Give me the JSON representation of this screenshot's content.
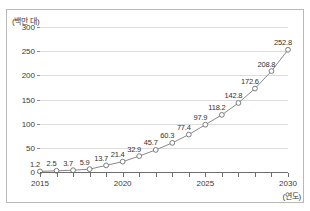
{
  "chart_data": {
    "type": "line",
    "title": "",
    "subtitle": "",
    "xlabel": "(연도)",
    "ylabel": "(백만 대)",
    "x": [
      2015,
      2016,
      2017,
      2018,
      2019,
      2020,
      2021,
      2022,
      2023,
      2024,
      2025,
      2026,
      2027,
      2028,
      2029,
      2030
    ],
    "categories": [
      "2015",
      "2016",
      "2017",
      "2018",
      "2019",
      "2020",
      "2021",
      "2022",
      "2023",
      "2024",
      "2025",
      "2026",
      "2027",
      "2028",
      "2029",
      "2030"
    ],
    "values": [
      1.2,
      2.5,
      3.7,
      5.9,
      13.7,
      21.4,
      32.9,
      45.7,
      60.3,
      77.4,
      97.9,
      118.2,
      142.8,
      172.6,
      208.8,
      252.8
    ],
    "point_labels": [
      "1.2",
      "2.5",
      "3.7",
      "5.9",
      "13.7",
      "21.4",
      "32.9",
      "45.7",
      "60.3",
      "77.4",
      "97.9",
      "118.2",
      "142.8",
      "172.6",
      "208.8",
      "252.8"
    ],
    "series": [
      {
        "name": "",
        "values": [
          1.2,
          2.5,
          3.7,
          5.9,
          13.7,
          21.4,
          32.9,
          45.7,
          60.3,
          77.4,
          97.9,
          118.2,
          142.8,
          172.6,
          208.8,
          252.8
        ],
        "marker": "open-circle",
        "line_color": "#8a8a8a",
        "marker_color": "#ffffff",
        "marker_edge_color": "#6e6e6e"
      }
    ],
    "ylim": [
      0,
      300
    ],
    "yticks": [
      0,
      50,
      100,
      150,
      200,
      250,
      300
    ],
    "ytick_labels": [
      "0",
      "50",
      "100",
      "150",
      "200",
      "250",
      "300"
    ],
    "xlim": [
      2015,
      2030
    ],
    "xticks": [
      2015,
      2016,
      2017,
      2018,
      2019,
      2020,
      2021,
      2022,
      2023,
      2024,
      2025,
      2026,
      2027,
      2028,
      2029,
      2030
    ],
    "xtick_labels_shown": [
      "2015",
      "2020",
      "2025",
      "2030"
    ],
    "grid": true,
    "grid_axis": "y",
    "grid_color": "#dcdcdc",
    "legend": false,
    "legend_position": "none",
    "frame_color": "#b9b9b9",
    "axis_color": "#6e6e6e",
    "background": "#ffffff"
  }
}
